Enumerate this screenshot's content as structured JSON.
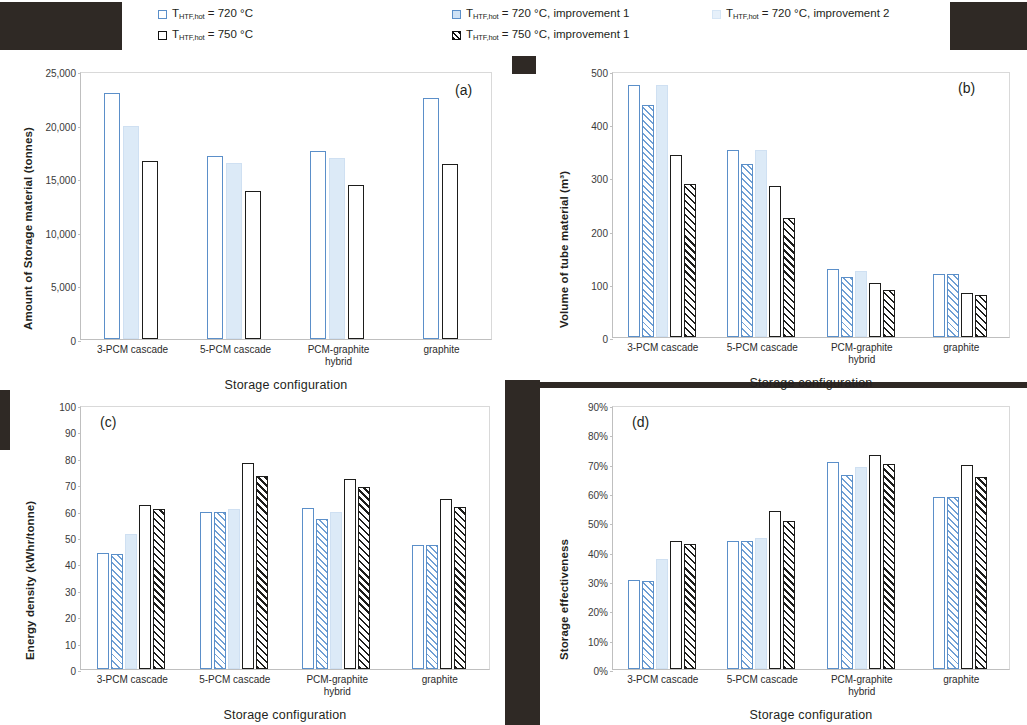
{
  "figure": {
    "xlabel": "Storage configuration",
    "categories": [
      "3-PCM cascade",
      "5-PCM cascade",
      "PCM-graphite hybrid",
      "graphite"
    ],
    "category_lines": [
      [
        "3-PCM cascade"
      ],
      [
        "5-PCM cascade"
      ],
      [
        "PCM-graphite",
        "hybrid"
      ],
      [
        "graphite"
      ]
    ]
  },
  "legend": {
    "items": [
      {
        "id": "s1",
        "prefix": "T",
        "sub": "HTF,hot",
        "text": " = 720 °C",
        "full": "T_HTF,hot = 720 °C",
        "color": "#5b8fc9"
      },
      {
        "id": "s4",
        "prefix": "T",
        "sub": "HTF,hot",
        "text": " = 750 °C",
        "full": "T_HTF,hot = 750 °C",
        "color": "#1d1d1b"
      },
      {
        "id": "s2",
        "prefix": "T",
        "sub": "HTF,hot",
        "text": " = 720 °C, improvement 1",
        "full": "T_HTF,hot = 720 °C, improvement 1",
        "color": "#5b8fc9"
      },
      {
        "id": "s5",
        "prefix": "T",
        "sub": "HTF,hot",
        "text": " = 750 °C, improvement 1",
        "full": "T_HTF,hot = 750 °C, improvement 1",
        "color": "#1d1d1b"
      },
      {
        "id": "s3",
        "prefix": "T",
        "sub": "HTF,hot",
        "text": " = 720 °C, improvement 2",
        "full": "T_HTF,hot = 720 °C, improvement 2",
        "color": "#cfe0f2"
      }
    ]
  },
  "chart_data": [
    {
      "panel": "(a)",
      "type": "bar",
      "title": "",
      "xlabel": "Storage configuration",
      "ylabel": "Amount of Storage material (tonnes)",
      "ylim": [
        0,
        25000
      ],
      "yticks": [
        0,
        5000,
        10000,
        15000,
        20000,
        25000
      ],
      "ytick_labels": [
        "0",
        "5,000",
        "10,000",
        "15,000",
        "20,000",
        "25,000"
      ],
      "grid": false,
      "categories": [
        "3-PCM cascade",
        "5-PCM cascade",
        "PCM-graphite hybrid",
        "graphite"
      ],
      "series": [
        {
          "name": "T_HTF,hot = 720 °C",
          "style": "s1",
          "values": [
            22950,
            17100,
            17500,
            22450
          ]
        },
        {
          "name": "T_HTF,hot = 720 °C, improvement 2",
          "style": "s3",
          "values": [
            19900,
            16450,
            16850,
            null
          ]
        },
        {
          "name": "T_HTF,hot = 750 °C",
          "style": "s4",
          "values": [
            16600,
            13800,
            14350,
            16300
          ]
        }
      ]
    },
    {
      "panel": "(b)",
      "type": "bar",
      "title": "",
      "xlabel": "Storage configuration",
      "ylabel": "Volume of tube material (m³)",
      "ylim": [
        0,
        500
      ],
      "yticks": [
        0,
        100,
        200,
        300,
        400,
        500
      ],
      "ytick_labels": [
        "0",
        "100",
        "200",
        "300",
        "400",
        "500"
      ],
      "grid": false,
      "categories": [
        "3-PCM cascade",
        "5-PCM cascade",
        "PCM-graphite hybrid",
        "graphite"
      ],
      "series": [
        {
          "name": "T_HTF,hot = 720 °C",
          "style": "s1",
          "values": [
            473,
            352,
            128,
            119
          ]
        },
        {
          "name": "T_HTF,hot = 720 °C, improvement 1",
          "style": "s2",
          "values": [
            436,
            326,
            112,
            119
          ]
        },
        {
          "name": "T_HTF,hot = 720 °C, improvement 2",
          "style": "s3",
          "values": [
            473,
            352,
            124,
            null
          ]
        },
        {
          "name": "T_HTF,hot = 750 °C",
          "style": "s4",
          "values": [
            342,
            283,
            101,
            83
          ]
        },
        {
          "name": "T_HTF,hot = 750 °C, improvement 1",
          "style": "s5",
          "values": [
            288,
            224,
            88,
            79
          ]
        }
      ]
    },
    {
      "panel": "(c)",
      "type": "bar",
      "title": "",
      "xlabel": "Storage configuration",
      "ylabel": "Energy density (kWhr/tonne)",
      "ylim": [
        0,
        100
      ],
      "yticks": [
        0,
        10,
        20,
        30,
        40,
        50,
        60,
        70,
        80,
        90,
        100
      ],
      "ytick_labels": [
        "0",
        "10",
        "20",
        "30",
        "40",
        "50",
        "60",
        "70",
        "80",
        "90",
        "100"
      ],
      "grid": false,
      "categories": [
        "3-PCM cascade",
        "5-PCM cascade",
        "PCM-graphite hybrid",
        "graphite"
      ],
      "series": [
        {
          "name": "T_HTF,hot = 720 °C",
          "style": "s1",
          "values": [
            44,
            59.5,
            61,
            47
          ]
        },
        {
          "name": "T_HTF,hot = 720 °C, improvement 1",
          "style": "s2",
          "values": [
            43.5,
            59.5,
            57,
            47
          ]
        },
        {
          "name": "T_HTF,hot = 720 °C, improvement 2",
          "style": "s3",
          "values": [
            51,
            60.5,
            59.5,
            null
          ]
        },
        {
          "name": "T_HTF,hot = 750 °C",
          "style": "s4",
          "values": [
            62,
            78,
            72,
            64.5
          ]
        },
        {
          "name": "T_HTF,hot = 750 °C, improvement 1",
          "style": "s5",
          "values": [
            60.5,
            73,
            69,
            61.5
          ]
        }
      ]
    },
    {
      "panel": "(d)",
      "type": "bar",
      "title": "",
      "xlabel": "Storage configuration",
      "ylabel": "Storage effectiveness",
      "ylim": [
        0,
        90
      ],
      "yticks": [
        0,
        10,
        20,
        30,
        40,
        50,
        60,
        70,
        80,
        90
      ],
      "ytick_labels": [
        "0%",
        "10%",
        "20%",
        "30%",
        "40%",
        "50%",
        "60%",
        "70%",
        "80%",
        "90%"
      ],
      "grid": false,
      "categories": [
        "3-PCM cascade",
        "5-PCM cascade",
        "PCM-graphite hybrid",
        "graphite"
      ],
      "series": [
        {
          "name": "T_HTF,hot = 720 °C",
          "style": "s1",
          "values": [
            30.5,
            43.5,
            70.5,
            58.5
          ]
        },
        {
          "name": "T_HTF,hot = 720 °C, improvement 1",
          "style": "s2",
          "values": [
            30,
            43.5,
            66,
            58.5
          ]
        },
        {
          "name": "T_HTF,hot = 720 °C, improvement 2",
          "style": "s3",
          "values": [
            37.5,
            44.5,
            69,
            null
          ]
        },
        {
          "name": "T_HTF,hot = 750 °C",
          "style": "s4",
          "values": [
            43.5,
            54,
            73,
            69.5
          ]
        },
        {
          "name": "T_HTF,hot = 750 °C, improvement 1",
          "style": "s5",
          "values": [
            42.5,
            50.5,
            70,
            65.5
          ]
        }
      ]
    }
  ]
}
